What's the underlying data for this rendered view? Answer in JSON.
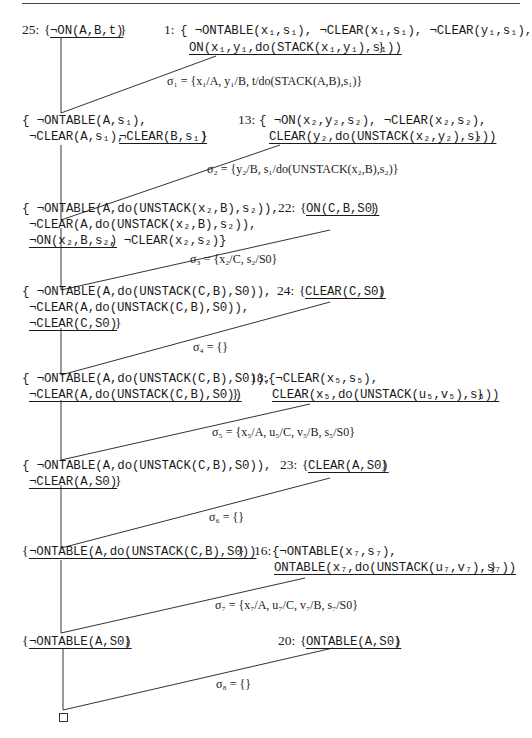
{
  "figure": {
    "type": "resolution-refutation-tree",
    "final_node": "□",
    "clauses": {
      "c25": {
        "label": "25:",
        "open": "{",
        "literal": "¬ON(A,B,t)",
        "close": "}"
      },
      "c1": {
        "label": "1:",
        "line1": "{ ¬ONTABLE(x₁,s₁), ¬CLEAR(x₁,s₁), ¬CLEAR(y₁,s₁),",
        "line2_literal": "ON(x₁,y₁,do(STACK(x₁,y₁),s₁))",
        "line2_close": "}"
      },
      "r1": {
        "line1": "{ ¬ONTABLE(A,s₁),",
        "line2_plain": "¬CLEAR(A,s₁), ",
        "line2_literal": "¬CLEAR(B,s₁)",
        "line2_close": "}"
      },
      "c13": {
        "label": "13:",
        "line1": "{ ¬ON(x₂,y₂,s₂), ¬CLEAR(x₂,s₂),",
        "line2_literal": "CLEAR(y₂,do(UNSTACK(x₂,y₂),s₂))",
        "line2_close": "}"
      },
      "r2": {
        "line1": "{ ¬ONTABLE(A,do(UNSTACK(x₂,B),s₂)),",
        "line2": "¬CLEAR(A,do(UNSTACK(x₂,B),s₂)),",
        "line3_literal": "¬ON(x₂,B,s₂)",
        "line3_plain": ", ¬CLEAR(x₂,s₂)}"
      },
      "c22": {
        "label": "22:",
        "open": "{",
        "literal": "ON(C,B,S0)",
        "close": "}"
      },
      "r3": {
        "line1": "{ ¬ONTABLE(A,do(UNSTACK(C,B),S0)),",
        "line2": "¬CLEAR(A,do(UNSTACK(C,B),S0)),",
        "line3_literal": "¬CLEAR(C,S0)",
        "line3_close": "}"
      },
      "c24": {
        "label": "24:",
        "open": "{",
        "literal": "CLEAR(C,S0)",
        "close": "}"
      },
      "r4": {
        "line1": "{ ¬ONTABLE(A,do(UNSTACK(C,B),S0)),",
        "line2_literal": "¬CLEAR(A,do(UNSTACK(C,B),S0))",
        "line2_close": "}"
      },
      "c18": {
        "label": "18:",
        "line1": "{¬CLEAR(x₅,s₅),",
        "line2_literal": "CLEAR(x₅,do(UNSTACK(u₅,v₅),s₅))",
        "line2_close": "}"
      },
      "r5": {
        "line1": "{ ¬ONTABLE(A,do(UNSTACK(C,B),S0)),",
        "line2_literal": "¬CLEAR(A,S0)",
        "line2_close": "}"
      },
      "c23": {
        "label": "23:",
        "open": "{",
        "literal": "CLEAR(A,S0)",
        "close": "}"
      },
      "r6": {
        "open": "{",
        "literal": "¬ONTABLE(A,do(UNSTACK(C,B),S0))",
        "close": "}"
      },
      "c16": {
        "label": "16:",
        "line1": "{¬ONTABLE(x₇,s₇),",
        "line2_literal": "ONTABLE(x₇,do(UNSTACK(u₇,v₇),s₇))",
        "line2_close": "}"
      },
      "r7": {
        "open": "{",
        "literal": "¬ONTABLE(A,S0)",
        "close": "}"
      },
      "c20": {
        "label": "20:",
        "open": "{",
        "literal": "ONTABLE(A,S0)",
        "close": "}"
      }
    },
    "substitutions": {
      "s1": "σ₁ = {x₁/A, y₁/B, t/do(STACK(A,B),s₁)}",
      "s2": "σ₂ = {y₂/B, s₁/do(UNSTACK(x₂,B),s₂)}",
      "s3": "σ₃ = {x₂/C, s₂/S0}",
      "s4": "σ₄ = {}",
      "s5": "σ₅ = {x₅/A, u₅/C, v₅/B, s₅/S0}",
      "s6": "σ₆ = {}",
      "s7": "σ₇ = {x₇/A, u₇/C, v₇/B, s₇/S0}",
      "s8": "σ₈ = {}"
    },
    "colors": {
      "ink": "#1a1a1a",
      "line": "#333333",
      "background": "#ffffff"
    }
  }
}
